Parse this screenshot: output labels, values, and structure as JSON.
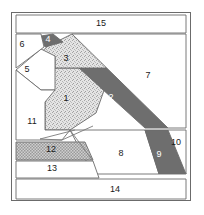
{
  "diagram": {
    "width": 204,
    "height": 215,
    "frame": {
      "x": 11,
      "y": 12,
      "width": 180,
      "height": 189,
      "stroke_color": "#6b6b6b",
      "fill_color": "#ffffff",
      "stroke_width": 1
    },
    "palette": {
      "outline": "#6b6b6b",
      "line": "#7a7a7a",
      "white_fill": "#ffffff",
      "stipple_fill": "#d9d9d9",
      "dark_fill": "#6e6e6e",
      "checker_fill": "#b5b5b5",
      "label_dark": "#1a1a1a",
      "label_light": "#ffffff",
      "page_background": "#ffffff"
    },
    "fill_styles": {
      "white": "plain-white",
      "stipple": "fine-stipple-texture",
      "dark": "solid-dark-gray",
      "checker": "cross-hatch-checker-texture"
    },
    "regions": [
      {
        "id": "region-1",
        "label": "1",
        "fill": "stipple",
        "label_color": "dark",
        "label_x": 66,
        "label_y": 99,
        "points": "55,68 112,68 96,113 70,130 45,130 45,102"
      },
      {
        "id": "region-2",
        "label": "2",
        "fill": "dark",
        "label_color": "light",
        "label_x": 111,
        "label_y": 98,
        "points": "79,68 112,68 168,128 145,128"
      },
      {
        "id": "region-3",
        "label": "3",
        "fill": "stipple",
        "label_color": "dark",
        "label_x": 66,
        "label_y": 59,
        "points": "48,46 72,34 112,68 55,68 55,56 37,56"
      },
      {
        "id": "region-4",
        "label": "4",
        "fill": "dark",
        "label_color": "light",
        "label_x": 48,
        "label_y": 40,
        "points": "41,36 53,34 63,42 45,47"
      },
      {
        "id": "region-5",
        "label": "5",
        "fill": "white",
        "label_color": "dark",
        "label_x": 27,
        "label_y": 70,
        "points": "16,70 41,49 55,56 55,90 41,90"
      },
      {
        "id": "region-6",
        "label": "6",
        "fill": "white",
        "label_color": "dark",
        "label_x": 22,
        "label_y": 45,
        "points": "16,34 41,34 44,47 16,68"
      },
      {
        "id": "region-7",
        "label": "7",
        "fill": "white",
        "label_color": "dark",
        "label_x": 148,
        "label_y": 76,
        "points": "72,34 186,34 186,128 168,128"
      },
      {
        "id": "region-8",
        "label": "8",
        "fill": "white",
        "label_color": "dark",
        "label_x": 121,
        "label_y": 154,
        "points": "70,130 145,130 159,174 93,174"
      },
      {
        "id": "region-9",
        "label": "9",
        "fill": "dark",
        "label_color": "light",
        "label_x": 159,
        "label_y": 155,
        "points": "145,130 168,130 186,174 159,174"
      },
      {
        "id": "region-10",
        "label": "10",
        "fill": "white",
        "label_color": "dark",
        "label_x": 176,
        "label_y": 143,
        "points": "168,130 186,130 186,174"
      },
      {
        "id": "region-11",
        "label": "11",
        "fill": "white",
        "label_color": "dark",
        "label_x": 32,
        "label_y": 122,
        "points": "16,70 41,90 55,90 45,102 45,130 70,130 62,140 16,140"
      },
      {
        "id": "region-12",
        "label": "12",
        "fill": "checker",
        "label_color": "dark",
        "label_x": 51,
        "label_y": 150,
        "points": "16,142 85,142 93,160 16,160"
      },
      {
        "id": "region-13",
        "label": "13",
        "fill": "white",
        "label_color": "dark",
        "label_x": 52,
        "label_y": 169,
        "points": "16,161 93,161 99,178 16,178"
      },
      {
        "id": "region-14",
        "label": "14",
        "fill": "white",
        "label_color": "dark",
        "label_x": 115,
        "label_y": 190,
        "points": "16,179 186,179 186,199 16,199"
      },
      {
        "id": "region-15",
        "label": "15",
        "fill": "white",
        "label_color": "dark",
        "label_x": 101,
        "label_y": 24,
        "points": "16,15 186,15 186,33 16,33"
      }
    ],
    "extra_lines": [
      {
        "id": "line-12-top-left",
        "x1": 40,
        "y1": 139,
        "x2": 62,
        "y2": 140
      },
      {
        "id": "line-12-diag",
        "x1": 40,
        "y1": 139,
        "x2": 75,
        "y2": 130
      },
      {
        "id": "line-12-diag-2",
        "x1": 62,
        "y1": 140,
        "x2": 93,
        "y2": 126
      },
      {
        "id": "line-13-cut",
        "x1": 93,
        "y1": 161,
        "x2": 70,
        "y2": 130
      }
    ]
  }
}
